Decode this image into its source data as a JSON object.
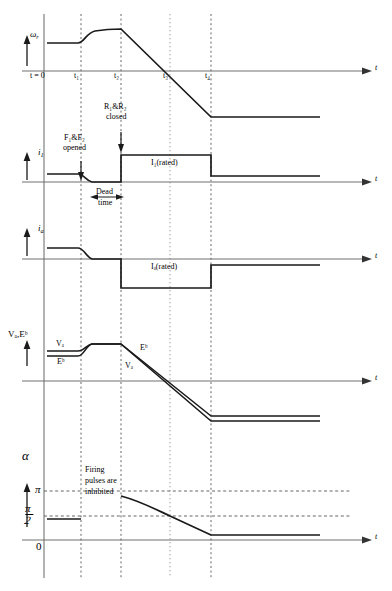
{
  "figure": {
    "time_axis_label": "t",
    "time_ticks": [
      {
        "label": "t = 0",
        "x": 44
      },
      {
        "label": "t₁",
        "x": 81
      },
      {
        "label": "t₂",
        "x": 121
      },
      {
        "label": "t₃",
        "x": 170
      },
      {
        "label": "t₄",
        "x": 211
      }
    ]
  },
  "panels": [
    {
      "id": "speed",
      "axis_label": "ω",
      "axis_sub": "r",
      "baseline_y": 71
    },
    {
      "id": "field-current",
      "axis_label": "i",
      "axis_sub": "1",
      "baseline_y": 182,
      "level_label": "I₁(rated)"
    },
    {
      "id": "armature-current",
      "axis_label": "i",
      "axis_sub": "a",
      "baseline_y": 259,
      "level_label": "Iₐ(rated)"
    },
    {
      "id": "voltage",
      "axis_label": "Vₐ,Eᵇ",
      "baseline_y": 381,
      "curve_labels": [
        "Vₐ",
        "Eᵇ",
        "Eᵇ",
        "Vₐ"
      ]
    },
    {
      "id": "firing-angle",
      "axis_label": "α",
      "baseline_y": 540,
      "y_ticks": [
        {
          "label": "π",
          "y": 491
        },
        {
          "label_num": "π",
          "label_den": "2",
          "y": 516
        },
        {
          "label": "0",
          "y": 540
        }
      ]
    }
  ],
  "annotations": {
    "r_closed_line1": "R₁&R₂",
    "r_closed_line2": "closed",
    "f_opened_line1": "F₁&F₂",
    "f_opened_line2": "opened",
    "dead_time_line1": "Dead",
    "dead_time_line2": "time",
    "firing_inhibited_line1": "Firing",
    "firing_inhibited_line2": "pulses are",
    "firing_inhibited_line3": "inhibited",
    "i1_rated": "I₁(rated)",
    "ia_rated": "Iₐ(rated)",
    "va_upper": "Vₐ",
    "eb_lower": "Eᵇ",
    "eb_mid": "Eᵇ",
    "va_mid": "Vₐ"
  },
  "colors": {
    "trace": "#1a1a1a",
    "axis": "#555555",
    "guide": "#777777",
    "background": "#ffffff"
  }
}
